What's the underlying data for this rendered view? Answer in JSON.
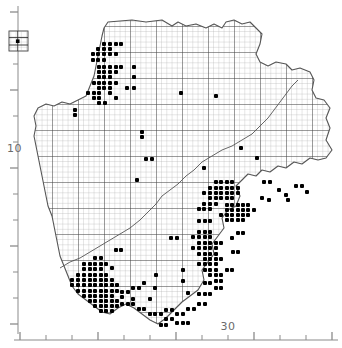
{
  "figure": {
    "background": "#ffffff",
    "ink": "#000000",
    "grid_color": "#8d8d8d",
    "major_grid_color": "#3a3a3a",
    "coast_color": "#555555",
    "dot_color": "#000000",
    "axis_color": "#8b8b8b",
    "label_color": "#6a6a6a"
  },
  "legend": {
    "name": "grid-square-key-inset",
    "x": 9,
    "y": 31,
    "width": 19,
    "height": 20,
    "description": "small inset box showing a sample of the 10 km grid square subdivision used for the dot symbols"
  },
  "axes": {
    "left": {
      "name": "northing-axis",
      "label": "10",
      "label_x": 7,
      "label_y": 152,
      "line_x": 18,
      "line_y1": 6,
      "line_y2": 334,
      "major_ticks": [
        12,
        38,
        64,
        90,
        116,
        142,
        168,
        194,
        220,
        246,
        272,
        298,
        324
      ],
      "labeled_tick": 155
    },
    "bottom": {
      "name": "easting-axis",
      "label": "30",
      "label_x": 228,
      "label_y": 330,
      "line_y": 340,
      "line_x1": 14,
      "line_x2": 338,
      "major_ticks": [
        20,
        46,
        72,
        98,
        124,
        150,
        176,
        202,
        228,
        254,
        280,
        306,
        332
      ],
      "labeled_tick": 228
    }
  },
  "chart_data": {
    "type": "scatter",
    "subtitle": "",
    "xlabel": "",
    "ylabel": "",
    "x_tick_labels": [
      "30"
    ],
    "y_tick_labels": [
      "10"
    ],
    "grid": true,
    "grid_cell_px": 5.2,
    "major_every_n_cells": 5,
    "legend_position": "top-left-inset",
    "xlim": [
      20,
      338
    ],
    "ylim": [
      6,
      340
    ],
    "series": [
      {
        "name": "presence-records",
        "marker": "filled-square",
        "marker_size_px": 4,
        "color": "#000000",
        "count": 322,
        "points": [
          [
            104,
            44
          ],
          [
            110,
            44
          ],
          [
            116,
            44
          ],
          [
            121,
            44
          ],
          [
            98,
            49
          ],
          [
            104,
            49
          ],
          [
            110,
            49
          ],
          [
            93,
            54
          ],
          [
            98,
            54
          ],
          [
            104,
            54
          ],
          [
            110,
            54
          ],
          [
            116,
            54
          ],
          [
            93,
            60
          ],
          [
            98,
            60
          ],
          [
            104,
            60
          ],
          [
            99,
            67
          ],
          [
            104,
            67
          ],
          [
            110,
            67
          ],
          [
            116,
            67
          ],
          [
            121,
            67
          ],
          [
            134,
            67
          ],
          [
            99,
            72
          ],
          [
            104,
            72
          ],
          [
            110,
            72
          ],
          [
            116,
            72
          ],
          [
            99,
            77
          ],
          [
            104,
            77
          ],
          [
            110,
            77
          ],
          [
            134,
            77
          ],
          [
            94,
            83
          ],
          [
            99,
            83
          ],
          [
            104,
            83
          ],
          [
            110,
            83
          ],
          [
            116,
            83
          ],
          [
            99,
            88
          ],
          [
            104,
            88
          ],
          [
            110,
            88
          ],
          [
            127,
            88
          ],
          [
            134,
            88
          ],
          [
            88,
            93
          ],
          [
            94,
            93
          ],
          [
            99,
            93
          ],
          [
            110,
            93
          ],
          [
            94,
            98
          ],
          [
            99,
            98
          ],
          [
            116,
            98
          ],
          [
            99,
            103
          ],
          [
            105,
            103
          ],
          [
            181,
            93
          ],
          [
            216,
            96
          ],
          [
            75,
            110
          ],
          [
            75,
            115
          ],
          [
            142,
            132
          ],
          [
            142,
            137
          ],
          [
            241,
            148
          ],
          [
            257,
            158
          ],
          [
            146,
            159
          ],
          [
            152,
            159
          ],
          [
            137,
            180
          ],
          [
            204,
            168
          ],
          [
            216,
            182
          ],
          [
            221,
            182
          ],
          [
            227,
            182
          ],
          [
            232,
            182
          ],
          [
            210,
            188
          ],
          [
            216,
            188
          ],
          [
            221,
            188
          ],
          [
            227,
            188
          ],
          [
            232,
            188
          ],
          [
            238,
            188
          ],
          [
            204,
            193
          ],
          [
            210,
            193
          ],
          [
            216,
            193
          ],
          [
            221,
            193
          ],
          [
            227,
            193
          ],
          [
            232,
            193
          ],
          [
            238,
            193
          ],
          [
            210,
            198
          ],
          [
            216,
            198
          ],
          [
            221,
            198
          ],
          [
            227,
            198
          ],
          [
            232,
            198
          ],
          [
            204,
            204
          ],
          [
            210,
            204
          ],
          [
            216,
            204
          ],
          [
            199,
            209
          ],
          [
            204,
            209
          ],
          [
            210,
            209
          ],
          [
            227,
            205
          ],
          [
            232,
            205
          ],
          [
            238,
            205
          ],
          [
            243,
            205
          ],
          [
            248,
            205
          ],
          [
            227,
            210
          ],
          [
            232,
            210
          ],
          [
            238,
            210
          ],
          [
            243,
            210
          ],
          [
            248,
            210
          ],
          [
            254,
            210
          ],
          [
            221,
            215
          ],
          [
            227,
            215
          ],
          [
            232,
            215
          ],
          [
            238,
            215
          ],
          [
            243,
            215
          ],
          [
            248,
            215
          ],
          [
            227,
            220
          ],
          [
            232,
            220
          ],
          [
            238,
            220
          ],
          [
            243,
            220
          ],
          [
            199,
            221
          ],
          [
            205,
            221
          ],
          [
            210,
            221
          ],
          [
            262,
            198
          ],
          [
            269,
            200
          ],
          [
            286,
            195
          ],
          [
            279,
            190
          ],
          [
            199,
            232
          ],
          [
            205,
            232
          ],
          [
            210,
            232
          ],
          [
            193,
            237
          ],
          [
            199,
            237
          ],
          [
            205,
            237
          ],
          [
            210,
            237
          ],
          [
            171,
            238
          ],
          [
            177,
            238
          ],
          [
            199,
            243
          ],
          [
            205,
            243
          ],
          [
            210,
            243
          ],
          [
            193,
            248
          ],
          [
            199,
            248
          ],
          [
            205,
            248
          ],
          [
            210,
            248
          ],
          [
            216,
            248
          ],
          [
            199,
            254
          ],
          [
            205,
            254
          ],
          [
            210,
            254
          ],
          [
            216,
            254
          ],
          [
            205,
            259
          ],
          [
            210,
            259
          ],
          [
            216,
            259
          ],
          [
            221,
            259
          ],
          [
            199,
            264
          ],
          [
            205,
            264
          ],
          [
            210,
            264
          ],
          [
            216,
            264
          ],
          [
            205,
            270
          ],
          [
            210,
            270
          ],
          [
            216,
            270
          ],
          [
            116,
            250
          ],
          [
            121,
            250
          ],
          [
            95,
            258
          ],
          [
            101,
            258
          ],
          [
            84,
            264
          ],
          [
            90,
            264
          ],
          [
            95,
            264
          ],
          [
            101,
            264
          ],
          [
            106,
            264
          ],
          [
            84,
            269
          ],
          [
            90,
            269
          ],
          [
            95,
            269
          ],
          [
            101,
            269
          ],
          [
            78,
            275
          ],
          [
            84,
            275
          ],
          [
            90,
            275
          ],
          [
            95,
            275
          ],
          [
            101,
            275
          ],
          [
            106,
            275
          ],
          [
            72,
            280
          ],
          [
            78,
            280
          ],
          [
            84,
            280
          ],
          [
            90,
            280
          ],
          [
            95,
            280
          ],
          [
            101,
            280
          ],
          [
            106,
            280
          ],
          [
            112,
            280
          ],
          [
            72,
            285
          ],
          [
            78,
            285
          ],
          [
            84,
            285
          ],
          [
            90,
            285
          ],
          [
            95,
            285
          ],
          [
            101,
            285
          ],
          [
            106,
            285
          ],
          [
            112,
            285
          ],
          [
            117,
            285
          ],
          [
            78,
            291
          ],
          [
            84,
            291
          ],
          [
            90,
            291
          ],
          [
            95,
            291
          ],
          [
            101,
            291
          ],
          [
            106,
            291
          ],
          [
            112,
            291
          ],
          [
            117,
            291
          ],
          [
            84,
            296
          ],
          [
            90,
            296
          ],
          [
            95,
            296
          ],
          [
            101,
            296
          ],
          [
            106,
            296
          ],
          [
            112,
            296
          ],
          [
            90,
            301
          ],
          [
            95,
            301
          ],
          [
            101,
            301
          ],
          [
            106,
            301
          ],
          [
            112,
            301
          ],
          [
            117,
            301
          ],
          [
            95,
            306
          ],
          [
            101,
            306
          ],
          [
            106,
            306
          ],
          [
            112,
            306
          ],
          [
            117,
            306
          ],
          [
            101,
            311
          ],
          [
            106,
            311
          ],
          [
            112,
            311
          ],
          [
            122,
            292
          ],
          [
            128,
            292
          ],
          [
            122,
            297
          ],
          [
            133,
            288
          ],
          [
            139,
            288
          ],
          [
            144,
            283
          ],
          [
            155,
            288
          ],
          [
            122,
            304
          ],
          [
            128,
            304
          ],
          [
            133,
            304
          ],
          [
            139,
            309
          ],
          [
            144,
            309
          ],
          [
            150,
            314
          ],
          [
            155,
            314
          ],
          [
            161,
            314
          ],
          [
            166,
            319
          ],
          [
            172,
            319
          ],
          [
            177,
            314
          ],
          [
            183,
            314
          ],
          [
            188,
            309
          ],
          [
            194,
            309
          ],
          [
            199,
            304
          ],
          [
            205,
            304
          ],
          [
            199,
            294
          ],
          [
            205,
            294
          ],
          [
            210,
            294
          ],
          [
            216,
            288
          ],
          [
            221,
            288
          ],
          [
            205,
            283
          ],
          [
            210,
            283
          ],
          [
            188,
            293
          ],
          [
            166,
            310
          ],
          [
            172,
            310
          ],
          [
            177,
            323
          ],
          [
            183,
            323
          ],
          [
            188,
            323
          ],
          [
            161,
            325
          ],
          [
            166,
            325
          ],
          [
            210,
            275
          ],
          [
            216,
            275
          ],
          [
            221,
            275
          ],
          [
            216,
            281
          ],
          [
            221,
            281
          ],
          [
            227,
            270
          ],
          [
            232,
            270
          ],
          [
            183,
            281
          ],
          [
            150,
            299
          ],
          [
            133,
            299
          ],
          [
            238,
            233
          ],
          [
            243,
            233
          ],
          [
            216,
            243
          ],
          [
            221,
            243
          ],
          [
            232,
            238
          ],
          [
            264,
            182
          ],
          [
            270,
            182
          ],
          [
            296,
            186
          ],
          [
            302,
            186
          ],
          [
            307,
            192
          ],
          [
            288,
            200
          ],
          [
            233,
            252
          ],
          [
            238,
            252
          ],
          [
            183,
            270
          ],
          [
            156,
            275
          ],
          [
            112,
            268
          ]
        ]
      }
    ]
  },
  "map": {
    "name": "region-outline",
    "description": "irregular county/region coastline outline filled with a fine 10 km reference grid, plus an internal administrative boundary running from the south-west to the north-east",
    "outer_boundary": "M 108,22 L 132,20 L 146,22 L 162,20 L 172,26 L 178,22 L 186,26 L 196,24 L 206,28 L 214,24 L 222,28 L 226,22 L 234,20 L 242,24 L 250,22 L 256,28 L 262,34 L 260,44 L 256,54 L 260,62 L 268,66 L 276,62 L 286,64 L 292,70 L 300,68 L 310,72 L 314,80 L 312,90 L 316,98 L 324,100 L 330,108 L 326,118 L 330,128 L 326,140 L 332,150 L 326,158 L 318,160 L 310,158 L 302,164 L 294,162 L 286,168 L 278,166 L 270,172 L 262,170 L 256,176 L 248,174 L 242,180 L 236,186 L 240,196 L 236,206 L 228,210 L 222,218 L 224,228 L 218,236 L 212,244 L 214,254 L 208,262 L 202,270 L 204,280 L 198,290 L 190,296 L 182,302 L 174,310 L 166,318 L 158,324 L 150,320 L 142,314 L 134,308 L 126,304 L 118,308 L 110,314 L 102,312 L 94,306 L 86,300 L 78,294 L 72,286 L 68,276 L 64,266 L 60,256 L 58,246 L 56,236 L 54,226 L 52,216 L 48,206 L 46,196 L 44,186 L 42,176 L 40,166 L 38,156 L 36,146 L 34,136 L 36,126 L 34,116 L 38,108 L 46,104 L 54,106 L 62,102 L 70,104 L 78,100 L 86,96 L 90,86 L 94,76 L 96,66 L 98,56 L 100,46 L 102,36 L 104,28 Z",
    "internal_boundary": "M 60,268 L 70,262 L 80,258 L 90,252 L 100,246 L 110,240 L 120,234 L 130,228 L 140,220 L 148,212 L 156,204 L 162,196 L 170,190 L 178,184 L 186,176 L 194,170 L 202,162 L 212,156 L 222,150 L 232,146 L 242,140 L 252,134 L 260,126 L 268,118 L 274,110 L 280,102 L 286,94 L 292,86 L 298,80"
  }
}
